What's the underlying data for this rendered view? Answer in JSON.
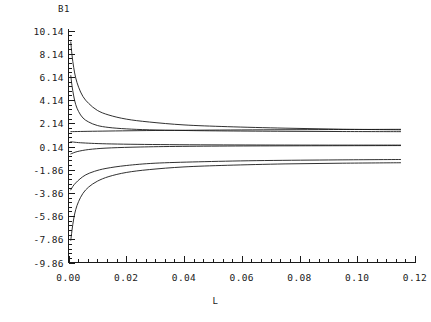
{
  "chart_data": {
    "type": "line",
    "title": "",
    "xlabel": "L",
    "ylabel": "B1",
    "xlim": [
      0.0,
      0.12
    ],
    "ylim": [
      -9.86,
      10.14
    ],
    "grid": false,
    "legend": "none",
    "x_ticks": [
      "0.00",
      "0.02",
      "0.04",
      "0.06",
      "0.08",
      "0.10",
      "0.12"
    ],
    "x_tick_values": [
      0.0,
      0.02,
      0.04,
      0.06,
      0.08,
      0.1,
      0.12
    ],
    "y_ticks": [
      "10.14",
      "8.14",
      "6.14",
      "4.14",
      "2.14",
      "0.14",
      "-1.86",
      "-3.86",
      "-5.86",
      "-7.86",
      "-9.86"
    ],
    "y_tick_values": [
      10.14,
      8.14,
      6.14,
      4.14,
      2.14,
      0.14,
      -1.86,
      -3.86,
      -5.86,
      -7.86,
      -9.86
    ],
    "x_minor_ticks_per_interval": 5,
    "y_minor_ticks_per_interval": 4,
    "x_data_max": 0.115,
    "line_color": "#1a1a1a",
    "series": [
      {
        "name": "branch-1",
        "note": "steep decay from high positive, asymptote near 1.55",
        "x": [
          0.0008,
          0.0012,
          0.0018,
          0.0025,
          0.0035,
          0.005,
          0.007,
          0.01,
          0.014,
          0.02,
          0.028,
          0.04,
          0.055,
          0.075,
          0.095,
          0.115
        ],
        "y": [
          9.15,
          8.05,
          6.95,
          6.05,
          5.25,
          4.45,
          3.85,
          3.25,
          2.85,
          2.5,
          2.25,
          2.0,
          1.85,
          1.72,
          1.63,
          1.58
        ]
      },
      {
        "name": "branch-2",
        "note": "decay from about 6.3, asymptote near 1.45",
        "x": [
          0.0008,
          0.0012,
          0.0018,
          0.0025,
          0.0035,
          0.005,
          0.007,
          0.01,
          0.014,
          0.02,
          0.028,
          0.04,
          0.055,
          0.075,
          0.095,
          0.115
        ],
        "y": [
          6.25,
          5.4,
          4.5,
          3.75,
          3.15,
          2.6,
          2.25,
          1.95,
          1.78,
          1.66,
          1.58,
          1.52,
          1.48,
          1.45,
          1.43,
          1.42
        ]
      },
      {
        "name": "branch-3",
        "note": "near-horizontal upper line, slight rise to about 1.62",
        "x": [
          0.0008,
          0.01,
          0.03,
          0.06,
          0.09,
          0.115
        ],
        "y": [
          1.42,
          1.46,
          1.52,
          1.57,
          1.6,
          1.62
        ]
      },
      {
        "name": "branch-4",
        "note": "central dark asymptotic line near 0.26",
        "x": [
          0.0008,
          0.005,
          0.015,
          0.035,
          0.065,
          0.09,
          0.115
        ],
        "y": [
          0.55,
          0.45,
          0.36,
          0.3,
          0.27,
          0.26,
          0.26
        ]
      },
      {
        "name": "branch-5",
        "note": "rises from about -0.45 toward 0.2",
        "x": [
          0.0008,
          0.003,
          0.007,
          0.013,
          0.022,
          0.035,
          0.055,
          0.08,
          0.115
        ],
        "y": [
          -0.5,
          -0.3,
          -0.12,
          0.0,
          0.08,
          0.14,
          0.18,
          0.2,
          0.22
        ]
      },
      {
        "name": "branch-6",
        "note": "rises from about -3.6, asymptote near -1.0",
        "x": [
          0.0008,
          0.0015,
          0.0025,
          0.004,
          0.006,
          0.009,
          0.013,
          0.02,
          0.03,
          0.045,
          0.065,
          0.09,
          0.115
        ],
        "y": [
          -3.6,
          -3.3,
          -3.0,
          -2.65,
          -2.3,
          -2.0,
          -1.75,
          -1.5,
          -1.3,
          -1.18,
          -1.08,
          -1.02,
          -0.98
        ]
      },
      {
        "name": "branch-7",
        "note": "steep rise from about -7.9, asymptote near -1.25",
        "x": [
          0.0008,
          0.0012,
          0.0018,
          0.0025,
          0.0035,
          0.005,
          0.007,
          0.01,
          0.014,
          0.02,
          0.028,
          0.04,
          0.055,
          0.075,
          0.095,
          0.115
        ],
        "y": [
          -7.95,
          -7.1,
          -6.1,
          -5.3,
          -4.6,
          -3.9,
          -3.35,
          -2.85,
          -2.45,
          -2.1,
          -1.85,
          -1.62,
          -1.48,
          -1.36,
          -1.3,
          -1.26
        ]
      }
    ]
  }
}
